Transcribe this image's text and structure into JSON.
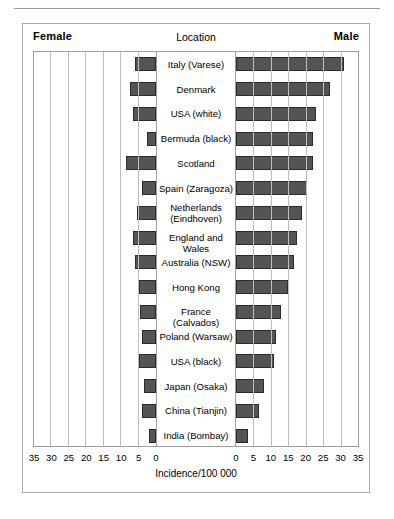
{
  "figure": {
    "header": {
      "left_label": "Female",
      "center_label": "Location",
      "right_label": "Male"
    },
    "axis_caption": "Incidence/100 000",
    "axis": {
      "left_ticks": [
        "35",
        "30",
        "25",
        "20",
        "15",
        "10",
        "5",
        "0"
      ],
      "right_ticks": [
        "0",
        "5",
        "10",
        "15",
        "20",
        "25",
        "30",
        "35"
      ]
    },
    "colors": {
      "bar_fill": "#545454",
      "bar_stroke": "#2b2b2b",
      "gridline": "#bdbdbd",
      "frame": "#9e9e9e",
      "panel_border": "#a8a8a8"
    }
  },
  "chart_data": {
    "type": "bar",
    "title": "",
    "subtitle": "",
    "xlabel": "Incidence/100 000",
    "ylabel": "Location",
    "orientation": "horizontal",
    "layout": "population-pyramid",
    "grid": true,
    "gridline_step": 5,
    "legend_position": "header",
    "xlim_left": [
      35,
      0
    ],
    "xlim_right": [
      0,
      35
    ],
    "categories": [
      "Italy (Varese)",
      "Denmark",
      "USA (white)",
      "Bermuda (black)",
      "Scotland",
      "Spain (Zaragoza)",
      "Netherlands (Eindhoven)",
      "England and Wales",
      "Australia (NSW)",
      "Hong Kong",
      "France (Calvados)",
      "Poland (Warsaw)",
      "USA (black)",
      "Japan (Osaka)",
      "China (Tianjin)",
      "India (Bombay)"
    ],
    "category_lines": [
      [
        "Italy (Varese)"
      ],
      [
        "Denmark"
      ],
      [
        "USA (white)"
      ],
      [
        "Bermuda (black)"
      ],
      [
        "Scotland"
      ],
      [
        "Spain (Zaragoza)"
      ],
      [
        "Netherlands",
        "(Eindhoven)"
      ],
      [
        "England and Wales"
      ],
      [
        "Australia (NSW)"
      ],
      [
        "Hong Kong"
      ],
      [
        "France (Calvados)"
      ],
      [
        "Poland (Warsaw)"
      ],
      [
        "USA (black)"
      ],
      [
        "Japan (Osaka)"
      ],
      [
        "China (Tianjin)"
      ],
      [
        "India (Bombay)"
      ]
    ],
    "series": [
      {
        "name": "Female",
        "side": "left",
        "values": [
          6.0,
          7.5,
          6.5,
          2.5,
          8.5,
          4.0,
          5.5,
          6.5,
          6.0,
          5.0,
          4.5,
          4.0,
          5.0,
          3.5,
          4.0,
          2.0
        ]
      },
      {
        "name": "Male",
        "side": "right",
        "values": [
          31.0,
          27.0,
          23.0,
          22.0,
          22.0,
          20.5,
          19.0,
          17.5,
          16.5,
          15.0,
          13.0,
          11.5,
          11.0,
          8.0,
          6.5,
          3.5
        ]
      }
    ]
  }
}
